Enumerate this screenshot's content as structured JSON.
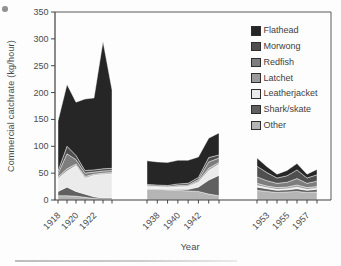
{
  "figure": {
    "y_axis_label": "Commercial catchrate (kg/hour)",
    "x_axis_label": "Year",
    "y_ticks": [
      "0",
      "50",
      "100",
      "150",
      "200",
      "250",
      "300",
      "350"
    ]
  },
  "legend": {
    "position": "top-right",
    "items": [
      {
        "label": "Flathead",
        "color": "#262626"
      },
      {
        "label": "Morwong",
        "color": "#4f4f4f"
      },
      {
        "label": "Redfish",
        "color": "#7d7d7d"
      },
      {
        "label": "Latchet",
        "color": "#9a9a9a"
      },
      {
        "label": "Leatherjacket",
        "color": "#ebebeb"
      },
      {
        "label": "Shark/skate",
        "color": "#606060"
      },
      {
        "label": "Other",
        "color": "#b5b5b5"
      }
    ]
  },
  "chart_data": {
    "type": "area",
    "stacked": true,
    "title": "",
    "xlabel": "Year",
    "ylabel": "Commercial catchrate (kg/hour)",
    "ylim": [
      0,
      350
    ],
    "y_tick_step": 50,
    "grid": false,
    "legend_position": "top-right inside plot",
    "stack_order_bottom_to_top": [
      "Other",
      "Shark/skate",
      "Leatherjacket",
      "Latchet",
      "Redfish",
      "Morwong",
      "Flathead"
    ],
    "panels": [
      {
        "name": "early-period",
        "years": [
          1918,
          1919,
          1920,
          1921,
          1922,
          1923,
          1924
        ],
        "labeled_years": [
          1918,
          1920,
          1922
        ],
        "totals": [
          147,
          215,
          182,
          188,
          190,
          295,
          205
        ],
        "series": [
          {
            "name": "Other",
            "values": [
              8,
              8,
              7,
              5,
              3,
              2,
              2
            ]
          },
          {
            "name": "Shark/skate",
            "values": [
              8,
              16,
              9,
              6,
              3,
              2,
              2
            ]
          },
          {
            "name": "Leatherjacket",
            "values": [
              24,
              30,
              48,
              30,
              40,
              44,
              45
            ]
          },
          {
            "name": "Latchet",
            "values": [
              3,
              4,
              3,
              3,
              2,
              2,
              2
            ]
          },
          {
            "name": "Redfish",
            "values": [
              6,
              28,
              8,
              6,
              4,
              4,
              4
            ]
          },
          {
            "name": "Morwong",
            "values": [
              5,
              14,
              8,
              5,
              4,
              4,
              4
            ]
          },
          {
            "name": "Flathead",
            "values": [
              93,
              115,
              99,
              133,
              134,
              237,
              146
            ]
          }
        ]
      },
      {
        "name": "middle-period",
        "years": [
          1937,
          1938,
          1939,
          1940,
          1941,
          1942,
          1943,
          1944
        ],
        "labeled_years": [
          1938,
          1940,
          1942
        ],
        "totals": [
          73,
          71,
          70,
          74,
          74,
          80,
          115,
          125
        ],
        "series": [
          {
            "name": "Other",
            "values": [
              20,
              20,
              19,
              18,
              17,
              16,
              11,
              8
            ]
          },
          {
            "name": "Shark/skate",
            "values": [
              1,
              1,
              1,
              2,
              3,
              8,
              26,
              38
            ]
          },
          {
            "name": "Leatherjacket",
            "values": [
              4,
              3,
              3,
              4,
              5,
              9,
              18,
              21
            ]
          },
          {
            "name": "Latchet",
            "values": [
              1,
              1,
              1,
              1,
              1,
              2,
              4,
              3
            ]
          },
          {
            "name": "Redfish",
            "values": [
              1,
              1,
              1,
              2,
              2,
              3,
              12,
              8
            ]
          },
          {
            "name": "Morwong",
            "values": [
              2,
              2,
              2,
              3,
              3,
              4,
              8,
              6
            ]
          },
          {
            "name": "Flathead",
            "values": [
              44,
              43,
              43,
              44,
              43,
              38,
              36,
              41
            ]
          }
        ]
      },
      {
        "name": "late-period",
        "years": [
          1952,
          1953,
          1954,
          1955,
          1956,
          1957,
          1958
        ],
        "labeled_years": [
          1953,
          1955,
          1957
        ],
        "totals": [
          78,
          62,
          48,
          55,
          68,
          48,
          57
        ],
        "series": [
          {
            "name": "Other",
            "values": [
              18,
              16,
              14,
              15,
              16,
              14,
              15
            ]
          },
          {
            "name": "Shark/skate",
            "values": [
              6,
              5,
              4,
              4,
              5,
              4,
              5
            ]
          },
          {
            "name": "Leatherjacket",
            "values": [
              3,
              2,
              2,
              2,
              3,
              2,
              2
            ]
          },
          {
            "name": "Latchet",
            "values": [
              4,
              3,
              3,
              3,
              4,
              3,
              3
            ]
          },
          {
            "name": "Redfish",
            "values": [
              12,
              10,
              8,
              9,
              12,
              8,
              10
            ]
          },
          {
            "name": "Morwong",
            "values": [
              20,
              15,
              10,
              12,
              16,
              10,
              12
            ]
          },
          {
            "name": "Flathead",
            "values": [
              15,
              11,
              7,
              10,
              12,
              7,
              10
            ]
          }
        ]
      }
    ]
  }
}
